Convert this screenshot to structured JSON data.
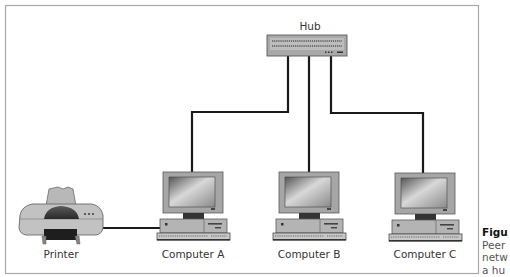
{
  "diagram": {
    "hub": {
      "label": "Hub"
    },
    "nodes": [
      {
        "id": "printer",
        "label": "Printer",
        "type": "printer"
      },
      {
        "id": "computer-a",
        "label": "Computer A",
        "type": "computer"
      },
      {
        "id": "computer-b",
        "label": "Computer B",
        "type": "computer"
      },
      {
        "id": "computer-c",
        "label": "Computer C",
        "type": "computer"
      }
    ],
    "connections": [
      {
        "from": "hub",
        "to": "computer-a"
      },
      {
        "from": "hub",
        "to": "computer-b"
      },
      {
        "from": "hub",
        "to": "computer-c"
      },
      {
        "from": "printer",
        "to": "computer-a"
      }
    ]
  },
  "caption": {
    "title": "Figu",
    "lines": [
      "Peer",
      "netw",
      "a hu"
    ]
  },
  "colors": {
    "frame": "#a8a8a8",
    "cable": "#1a1a1a",
    "device_body": "#a9a9a9",
    "device_dark": "#3a3a3a"
  }
}
